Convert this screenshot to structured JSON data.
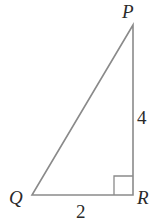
{
  "diagram": {
    "type": "right-triangle",
    "vertices": {
      "P": {
        "label": "P",
        "x": 133,
        "y": 25
      },
      "Q": {
        "label": "Q",
        "x": 32,
        "y": 195
      },
      "R": {
        "label": "R",
        "x": 133,
        "y": 195
      }
    },
    "sides": {
      "QR": {
        "label": "2"
      },
      "PR": {
        "label": "4"
      }
    },
    "right_angle_at": "R",
    "colors": {
      "line": "#8a8a8a",
      "text": "#2a2a2a"
    }
  }
}
